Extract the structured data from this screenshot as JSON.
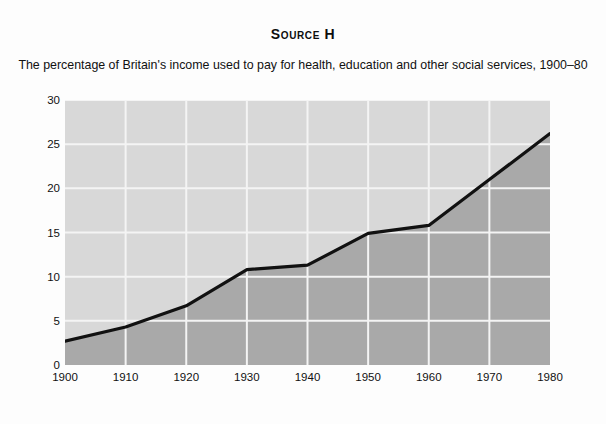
{
  "figure": {
    "title": "Source H",
    "subtitle": "The percentage of Britain's income used to pay for health, education and other social services, 1900–80"
  },
  "chart_data": {
    "type": "area",
    "title": "Source H",
    "subtitle": "The percentage of Britain's income used to pay for health, education and other social services, 1900–80",
    "xlabel": "",
    "ylabel": "% of national income",
    "x": [
      1900,
      1910,
      1920,
      1930,
      1940,
      1950,
      1960,
      1970,
      1980
    ],
    "values": [
      2.7,
      4.3,
      6.7,
      10.8,
      11.3,
      14.9,
      15.8,
      21.0,
      26.2
    ],
    "xticklabels": [
      "1900",
      "1910",
      "1920",
      "1930",
      "1940",
      "1950",
      "1960",
      "1970",
      "1980"
    ],
    "yticklabels": [
      "0",
      "5",
      "10",
      "15",
      "20",
      "25",
      "30"
    ],
    "yticks": [
      0,
      5,
      10,
      15,
      20,
      25,
      30
    ],
    "xlim": [
      1900,
      1980
    ],
    "ylim": [
      0,
      30
    ],
    "grid": true,
    "legend": false,
    "colors": {
      "line": "#111111",
      "fill_below": "#a9a9a9",
      "fill_above": "#d8d8d8",
      "gridline": "#f4f4f4",
      "background": "#fdfdfd"
    }
  }
}
